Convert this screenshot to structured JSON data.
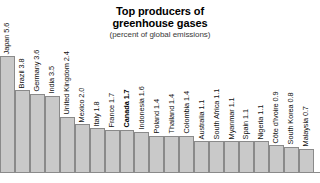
{
  "chart_data": {
    "type": "bar",
    "title": "Top producers of greenhouse gases",
    "title_line1": "Top producers of",
    "title_line2": "greenhouse gases",
    "subtitle": "(percent of global emissions)",
    "xlabel": "",
    "ylabel": "",
    "ylim": [
      0,
      6
    ],
    "grid": false,
    "legend": "none",
    "value_unit": "percent of global emissions",
    "highlight": "Canada",
    "categories": [
      "Japan",
      "Brazil",
      "Germany",
      "India",
      "United Kingdom",
      "Mexico",
      "Italy",
      "France",
      "Canada",
      "Indonesia",
      "Poland",
      "Thailand",
      "Colombia",
      "Australia",
      "South Africa",
      "Myanmar",
      "Spain",
      "Nigeria",
      "Côte d'Ivoire",
      "South Korea",
      "Malaysia"
    ],
    "values": [
      5.6,
      3.8,
      3.6,
      3.5,
      2.4,
      2.0,
      1.8,
      1.7,
      1.7,
      1.6,
      1.4,
      1.4,
      1.4,
      1.1,
      1.1,
      1.1,
      1.1,
      1.1,
      0.9,
      0.8,
      0.7
    ],
    "bars": [
      {
        "label": "Japan 5.6",
        "name": "Japan",
        "value": 5.6,
        "highlight": false
      },
      {
        "label": "Brazil 3.8",
        "name": "Brazil",
        "value": 3.8,
        "highlight": false
      },
      {
        "label": "Germany 3.6",
        "name": "Germany",
        "value": 3.6,
        "highlight": false
      },
      {
        "label": "India 3.5",
        "name": "India",
        "value": 3.5,
        "highlight": false
      },
      {
        "label": "United Kingdom 2.4",
        "name": "United Kingdom",
        "value": 2.4,
        "highlight": false
      },
      {
        "label": "Mexico 2.0",
        "name": "Mexico",
        "value": 2.0,
        "highlight": false
      },
      {
        "label": "Italy 1.8",
        "name": "Italy",
        "value": 1.8,
        "highlight": false
      },
      {
        "label": "France 1.7",
        "name": "France",
        "value": 1.7,
        "highlight": false
      },
      {
        "label": "Canada 1.7",
        "name": "Canada",
        "value": 1.7,
        "highlight": true
      },
      {
        "label": "Indonesia 1.6",
        "name": "Indonesia",
        "value": 1.6,
        "highlight": false
      },
      {
        "label": "Poland 1.4",
        "name": "Poland",
        "value": 1.4,
        "highlight": false
      },
      {
        "label": "Thailand 1.4",
        "name": "Thailand",
        "value": 1.4,
        "highlight": false
      },
      {
        "label": "Colombia 1.4",
        "name": "Colombia",
        "value": 1.4,
        "highlight": false
      },
      {
        "label": "Australia 1.1",
        "name": "Australia",
        "value": 1.1,
        "highlight": false
      },
      {
        "label": "South Africa 1.1",
        "name": "South Africa",
        "value": 1.1,
        "highlight": false
      },
      {
        "label": "Myanmar 1.1",
        "name": "Myanmar",
        "value": 1.1,
        "highlight": false
      },
      {
        "label": "Spain 1.1",
        "name": "Spain",
        "value": 1.1,
        "highlight": false
      },
      {
        "label": "Nigeria 1.1",
        "name": "Nigeria",
        "value": 1.1,
        "highlight": false
      },
      {
        "label": "Côte d'Ivoire 0.9",
        "name": "Côte d'Ivoire",
        "value": 0.9,
        "highlight": false
      },
      {
        "label": "South Korea 0.8",
        "name": "South Korea",
        "value": 0.8,
        "highlight": false
      },
      {
        "label": "Malaysia 0.7",
        "name": "Malaysia",
        "value": 0.7,
        "highlight": false
      }
    ],
    "colors": {
      "bar_fill": "#c9c9c9",
      "bar_border": "#8a8a8a",
      "title_text": "#000000",
      "subtitle_text": "#3a3a3a",
      "label_text": "#111111",
      "background": "#ffffff"
    }
  }
}
